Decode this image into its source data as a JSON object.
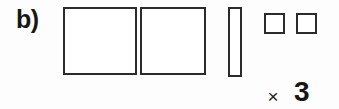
{
  "label": {
    "text": "b)"
  },
  "colors": {
    "background": "#fdfdfd",
    "stroke": "#2b2b2b",
    "text": "#171717",
    "shape_fill": "#ffffff"
  },
  "shapes": [
    {
      "name": "large-square-1",
      "kind": "square",
      "size": "large",
      "count": 1
    },
    {
      "name": "large-square-2",
      "kind": "square",
      "size": "large",
      "count": 1
    },
    {
      "name": "thin-vertical-rectangle",
      "kind": "rectangle",
      "size": "narrow-tall",
      "count": 1
    },
    {
      "name": "small-square-1",
      "kind": "square",
      "size": "small",
      "count": 1
    },
    {
      "name": "small-square-2",
      "kind": "square",
      "size": "small",
      "count": 1
    }
  ],
  "multiplier": {
    "operator": "×",
    "value": "3"
  }
}
